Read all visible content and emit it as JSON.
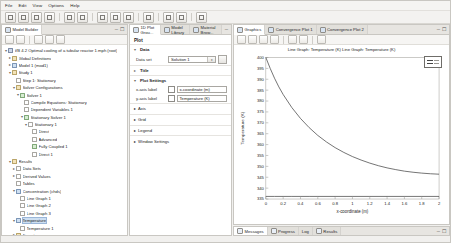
{
  "menu": {
    "items": [
      "File",
      "Edit",
      "View",
      "Options",
      "Help"
    ]
  },
  "toolbar": {
    "buttons": [
      {
        "name": "new-file-button"
      },
      {
        "name": "open-file-button"
      },
      {
        "name": "save-file-button"
      },
      {
        "name": "print-button"
      },
      {
        "name": "undo-button"
      },
      {
        "name": "redo-button"
      },
      {
        "name": "cut-button"
      },
      {
        "name": "copy-button"
      },
      {
        "name": "paste-button"
      },
      {
        "name": "delete-button"
      },
      {
        "name": "compute-button"
      },
      {
        "name": "plot-button"
      },
      {
        "name": "help-button"
      }
    ]
  },
  "model_builder": {
    "tab_label": "Model Builder",
    "toolbar_buttons": [
      "collapse-all",
      "expand-all",
      "previous-node",
      "next-node",
      "show-hide"
    ],
    "tree": [
      {
        "label": "VB 4.2 Optimal cooling of a tubular reactor 1.mph (root)",
        "depth": 0,
        "icon": "root",
        "twisty": "▾",
        "selected": false
      },
      {
        "label": "Global Definitions",
        "depth": 1,
        "icon": "folder",
        "twisty": "▸",
        "selected": false
      },
      {
        "label": "Model 1 (mod1)",
        "depth": 1,
        "icon": "blue",
        "twisty": "▸",
        "selected": false
      },
      {
        "label": "Study 1",
        "depth": 1,
        "icon": "folder",
        "twisty": "▾",
        "selected": false
      },
      {
        "label": "Step 1: Stationary",
        "depth": 2,
        "icon": "leaf",
        "twisty": "",
        "selected": false
      },
      {
        "label": "Solver Configurations",
        "depth": 2,
        "icon": "folder",
        "twisty": "▾",
        "selected": false
      },
      {
        "label": "Solver 1",
        "depth": 3,
        "icon": "green",
        "twisty": "▾",
        "selected": false
      },
      {
        "label": "Compile Equations: Stationary",
        "depth": 4,
        "icon": "leaf",
        "twisty": "",
        "selected": false
      },
      {
        "label": "Dependent Variables 1",
        "depth": 4,
        "icon": "leaf",
        "twisty": "",
        "selected": false
      },
      {
        "label": "Stationary Solver 1",
        "depth": 4,
        "icon": "green",
        "twisty": "▾",
        "selected": false
      },
      {
        "label": "Stationary 1",
        "depth": 5,
        "icon": "leaf",
        "twisty": "▾",
        "selected": false
      },
      {
        "label": "Direct",
        "depth": 6,
        "icon": "leaf",
        "twisty": "",
        "selected": false
      },
      {
        "label": "Advanced",
        "depth": 6,
        "icon": "leaf",
        "twisty": "",
        "selected": false
      },
      {
        "label": "Fully Coupled 1",
        "depth": 6,
        "icon": "green",
        "twisty": "",
        "selected": false
      },
      {
        "label": "Direct 1",
        "depth": 6,
        "icon": "leaf",
        "twisty": "",
        "selected": false
      },
      {
        "label": "Results",
        "depth": 1,
        "icon": "folder",
        "twisty": "▾",
        "selected": false
      },
      {
        "label": "Data Sets",
        "depth": 2,
        "icon": "leaf",
        "twisty": "▸",
        "selected": false
      },
      {
        "label": "Derived Values",
        "depth": 2,
        "icon": "leaf",
        "twisty": "▸",
        "selected": false
      },
      {
        "label": "Tables",
        "depth": 2,
        "icon": "leaf",
        "twisty": "",
        "selected": false
      },
      {
        "label": "Concentration (chds)",
        "depth": 2,
        "icon": "blue",
        "twisty": "▾",
        "selected": false
      },
      {
        "label": "Line Graph 1",
        "depth": 3,
        "icon": "leaf",
        "twisty": "",
        "selected": false
      },
      {
        "label": "Line Graph 2",
        "depth": 3,
        "icon": "leaf",
        "twisty": "",
        "selected": false
      },
      {
        "label": "Line Graph 3",
        "depth": 3,
        "icon": "leaf",
        "twisty": "",
        "selected": false
      },
      {
        "label": "Temperature",
        "depth": 2,
        "icon": "blue",
        "twisty": "▾",
        "selected": true
      },
      {
        "label": "Temperature 1",
        "depth": 3,
        "icon": "leaf",
        "twisty": "",
        "selected": false
      },
      {
        "label": "Export",
        "depth": 2,
        "icon": "folder",
        "twisty": "▸",
        "selected": false
      },
      {
        "label": "Reports",
        "depth": 2,
        "icon": "folder",
        "twisty": "▸",
        "selected": false
      }
    ]
  },
  "settings": {
    "tabs": [
      {
        "label": "1D Plot Grou...",
        "active": true
      },
      {
        "label": "Model Library",
        "active": false
      },
      {
        "label": "Material Brow...",
        "active": false
      }
    ],
    "header": "Plot",
    "sections": [
      {
        "name": "Data",
        "collapsed": false
      },
      {
        "name": "Title",
        "collapsed": true
      },
      {
        "name": "Plot Settings",
        "collapsed": false
      },
      {
        "name": "Axis",
        "collapsed": true
      },
      {
        "name": "Grid",
        "collapsed": true
      },
      {
        "name": "Legend",
        "collapsed": true
      },
      {
        "name": "Window Settings",
        "collapsed": true
      }
    ],
    "data_set_label": "Data set",
    "data_set_value": "Solution 1",
    "x_axis_label_caption": "x-axis label",
    "x_axis_label_value": "x-coordinate (m)",
    "y_axis_label_caption": "y-axis label",
    "y_axis_label_value": "Temperature (K)"
  },
  "graphics": {
    "tabs": [
      {
        "label": "Graphics",
        "active": true
      },
      {
        "label": "Convergence Plot 1",
        "active": false
      },
      {
        "label": "Convergence Plot 2",
        "active": false
      }
    ],
    "toolbar_buttons": [
      "zoom-in",
      "zoom-out",
      "zoom-extents",
      "zoom-box",
      "go-to-default-view",
      "transparency",
      "scene-light",
      "image-snapshot"
    ]
  },
  "chart_data": {
    "type": "line",
    "title": "Line Graph: Temperature (K)   Line Graph: Temperature (K)",
    "xlabel": "x-coordinate (m)",
    "ylabel": "Temperature (K)",
    "xlim": [
      0,
      2
    ],
    "ylim": [
      335,
      400
    ],
    "xticks": [
      "0",
      "0.2",
      "0.4",
      "0.6",
      "0.8",
      "1",
      "1.2",
      "1.4",
      "1.6",
      "1.8",
      "2"
    ],
    "yticks": [
      "400",
      "395",
      "390",
      "385",
      "380",
      "375",
      "370",
      "365",
      "360",
      "355",
      "350",
      "345",
      "340",
      "335"
    ],
    "grid": false,
    "legend": true,
    "legend_position": "upper right",
    "series": [
      {
        "name": "Temperature (K)",
        "color": "#3c3c3c",
        "x": [
          0,
          0.05,
          0.1,
          0.15,
          0.2,
          0.3,
          0.4,
          0.5,
          0.6,
          0.7,
          0.8,
          0.9,
          1.0,
          1.1,
          1.2,
          1.3,
          1.4,
          1.5,
          1.6,
          1.7,
          1.8,
          1.9,
          2.0
        ],
        "y": [
          400,
          395,
          390.5,
          386.5,
          383,
          377,
          372,
          367.8,
          364.2,
          361.2,
          358.6,
          356.4,
          354.5,
          352.9,
          351.5,
          350.3,
          349.3,
          348.5,
          347.8,
          347.3,
          346.9,
          346.6,
          346.4
        ]
      },
      {
        "name": "Temperature (K)",
        "color": "#3c3c3c",
        "x": [
          0,
          0.1,
          0.2,
          0.3,
          0.4,
          0.5,
          0.6,
          0.8,
          1.0,
          1.2,
          1.4,
          1.6,
          1.8,
          2.0
        ],
        "y": [
          336.2,
          336.2,
          336.2,
          336.2,
          336.2,
          336.2,
          336.2,
          336.2,
          336.2,
          336.2,
          336.2,
          336.2,
          336.2,
          336.2
        ]
      }
    ]
  },
  "bottom_tabs": [
    {
      "label": "Messages",
      "active": true
    },
    {
      "label": "Progress",
      "active": false
    },
    {
      "label": "Log",
      "active": false
    },
    {
      "label": "Results",
      "active": false
    }
  ]
}
